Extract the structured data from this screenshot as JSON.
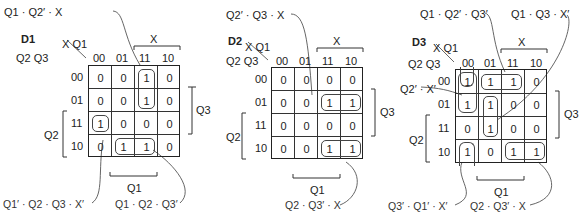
{
  "maps": [
    {
      "name": "D1",
      "col_vars": "X Q1",
      "row_vars": "Q2 Q3",
      "col_labels": [
        "00",
        "01",
        "11",
        "10"
      ],
      "row_labels": [
        "00",
        "01",
        "11",
        "10"
      ],
      "cells": [
        [
          "0",
          "0",
          "1",
          "0"
        ],
        [
          "0",
          "0",
          "1",
          "0"
        ],
        [
          "1",
          "0",
          "0",
          "0"
        ],
        [
          "0",
          "1",
          "1",
          "0"
        ]
      ],
      "bracket_labels": {
        "top": "X",
        "bottom": "Q1",
        "right": "Q3",
        "left": "Q2"
      },
      "terms": [
        "Q1 · Q2′ · X",
        "Q1′ · Q2 · Q3 · X′",
        "Q1 · Q2 · Q3′"
      ]
    },
    {
      "name": "D2",
      "col_vars": "X Q1",
      "row_vars": "Q2 Q3",
      "col_labels": [
        "00",
        "01",
        "11",
        "10"
      ],
      "row_labels": [
        "00",
        "01",
        "11",
        "10"
      ],
      "cells": [
        [
          "0",
          "0",
          "0",
          "0"
        ],
        [
          "0",
          "0",
          "1",
          "1"
        ],
        [
          "0",
          "0",
          "0",
          "0"
        ],
        [
          "0",
          "0",
          "1",
          "1"
        ]
      ],
      "bracket_labels": {
        "top": "X",
        "bottom": "Q1",
        "right": "Q3",
        "left": "Q2"
      },
      "terms": [
        "Q2′ · Q3 · X",
        "Q2 · Q3′ · X"
      ]
    },
    {
      "name": "D3",
      "col_vars": "X Q1",
      "row_vars": "Q2 Q3",
      "col_labels": [
        "00",
        "01",
        "11",
        "10"
      ],
      "row_labels": [
        "00",
        "01",
        "11",
        "10"
      ],
      "cells": [
        [
          "1",
          "1",
          "1",
          "0"
        ],
        [
          "1",
          "1",
          "0",
          "0"
        ],
        [
          "0",
          "1",
          "0",
          "0"
        ],
        [
          "1",
          "0",
          "1",
          "1"
        ]
      ],
      "bracket_labels": {
        "top": "X",
        "bottom": "Q1",
        "right": "Q3",
        "left": "Q2"
      },
      "terms": [
        "Q1 · Q2′ · Q3′",
        "Q1 · Q3 · X′",
        "Q2′ · X′",
        "Q3′ · Q1′ · X′",
        "Q2 · Q3′ · X"
      ]
    }
  ]
}
